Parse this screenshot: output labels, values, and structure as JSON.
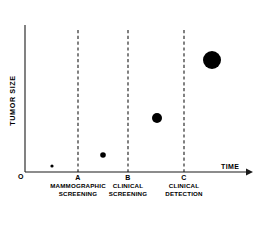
{
  "figure": {
    "type": "scatter",
    "background": "#ffffff",
    "ink_color": "#000000"
  },
  "axes": {
    "y_label": "TUMOR SIZE",
    "x_label": "TIME",
    "origin_label": "O",
    "x_axis_has_arrow": true,
    "grid": false
  },
  "markers": [
    {
      "letter": "A",
      "x_frac": 0.3422,
      "caption_line1": "MAMMOGRAPHIC",
      "caption_line2": "SCREENING"
    },
    {
      "letter": "B",
      "x_frac": 0.5645,
      "caption_line1": "CLINICAL",
      "caption_line2": "SCREENING"
    },
    {
      "letter": "C",
      "x_frac": 0.8134,
      "caption_line1": "CLINICAL",
      "caption_line2": "DETECTION"
    }
  ],
  "chart_data": {
    "type": "scatter",
    "title": "",
    "xlabel": "TIME",
    "ylabel": "TUMOR SIZE",
    "xlim": [
      0,
      1
    ],
    "ylim": [
      0,
      1
    ],
    "grid": false,
    "legend": null,
    "annotations": [
      "A - MAMMOGRAPHIC SCREENING",
      "B - CLINICAL SCREENING",
      "C - CLINICAL DETECTION"
    ],
    "points": [
      {
        "x": 52,
        "y": 166,
        "r": 1.6,
        "label": "subclinical tumor"
      },
      {
        "x": 103,
        "y": 155,
        "r": 2.8,
        "label": "mammographically detectable"
      },
      {
        "x": 157,
        "y": 118,
        "r": 5.0,
        "label": "clinically screenable"
      },
      {
        "x": 212,
        "y": 60,
        "r": 9.0,
        "label": "clinically detectable"
      }
    ],
    "reference_lines": [
      {
        "label": "A",
        "x": 78
      },
      {
        "label": "B",
        "x": 128
      },
      {
        "label": "C",
        "x": 184
      }
    ]
  },
  "geometry": {
    "axis_x0": 25,
    "axis_y0": 172,
    "axis_top": 25,
    "axis_right": 250,
    "dash_top": 30
  }
}
